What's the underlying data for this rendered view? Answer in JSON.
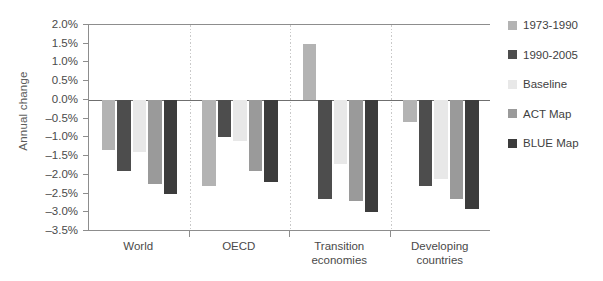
{
  "chart_data": {
    "type": "bar",
    "title": "",
    "xlabel": "",
    "ylabel": "Annual change",
    "ylim": [
      -3.5,
      2.0
    ],
    "ytick_step": 0.5,
    "ytick_labels": [
      "2.0%",
      "1.5%",
      "1.0%",
      "0.5%",
      "0.0%",
      "-0.5%",
      "-1.0%",
      "-1.5%",
      "-2.0%",
      "-2.5%",
      "-3.0%",
      "-3.5%"
    ],
    "ytick_values": [
      2.0,
      1.5,
      1.0,
      0.5,
      0.0,
      -0.5,
      -1.0,
      -1.5,
      -2.0,
      -2.5,
      -3.0,
      -3.5
    ],
    "categories": [
      "World",
      "OECD",
      "Transition economies",
      "Developing countries"
    ],
    "grid": false,
    "legend_position": "right",
    "series": [
      {
        "name": "1973-1990",
        "color": "#b3b3b3",
        "values": [
          -1.35,
          -2.3,
          1.5,
          -0.6
        ]
      },
      {
        "name": "1990-2005",
        "color": "#4d4d4d",
        "values": [
          -1.9,
          -1.0,
          -2.65,
          -2.3
        ]
      },
      {
        "name": "Baseline",
        "color": "#e8e8e8",
        "values": [
          -1.4,
          -1.1,
          -1.7,
          -2.1
        ]
      },
      {
        "name": "ACT Map",
        "color": "#9a9a9a",
        "values": [
          -2.25,
          -1.9,
          -2.7,
          -2.65
        ]
      },
      {
        "name": "BLUE Map",
        "color": "#3c3c3c",
        "values": [
          -2.5,
          -2.2,
          -3.0,
          -2.9
        ]
      }
    ]
  },
  "legend": {
    "items": [
      {
        "label": "1973-1990"
      },
      {
        "label": "1990-2005"
      },
      {
        "label": "Baseline"
      },
      {
        "label": "ACT Map"
      },
      {
        "label": "BLUE Map"
      }
    ]
  },
  "axis": {
    "y_title": "Annual change"
  },
  "categories": [
    {
      "line1": "World",
      "line2": ""
    },
    {
      "line1": "OECD",
      "line2": ""
    },
    {
      "line1": "Transition",
      "line2": "economies"
    },
    {
      "line1": "Developing",
      "line2": "countries"
    }
  ]
}
